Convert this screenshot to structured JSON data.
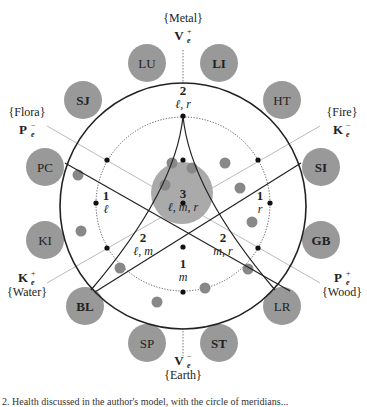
{
  "diagram": {
    "center": {
      "x": 183,
      "y": 206
    },
    "outer_radius": 123,
    "inner_dotted_radius": 87,
    "colors": {
      "node_fill": "#999999",
      "small_dot": "#888888",
      "center_blob": "#aaaaaa",
      "line": "#222222",
      "guide_line": "#bbbbbb",
      "text": "#222222"
    },
    "outer_nodes": [
      {
        "label": "LU",
        "bold": false,
        "x": 147,
        "y": 63
      },
      {
        "label": "LI",
        "bold": true,
        "x": 219,
        "y": 63
      },
      {
        "label": "HT",
        "bold": false,
        "x": 282,
        "y": 100
      },
      {
        "label": "SI",
        "bold": true,
        "x": 321,
        "y": 167
      },
      {
        "label": "GB",
        "bold": true,
        "x": 321,
        "y": 240
      },
      {
        "label": "LR",
        "bold": false,
        "x": 282,
        "y": 306
      },
      {
        "label": "ST",
        "bold": true,
        "x": 219,
        "y": 343
      },
      {
        "label": "SP",
        "bold": false,
        "x": 147,
        "y": 343
      },
      {
        "label": "BL",
        "bold": true,
        "x": 85,
        "y": 306
      },
      {
        "label": "KI",
        "bold": false,
        "x": 45,
        "y": 240
      },
      {
        "label": "PC",
        "bold": false,
        "x": 45,
        "y": 167
      },
      {
        "label": "SJ",
        "bold": true,
        "x": 83,
        "y": 100
      }
    ],
    "element_labels": [
      {
        "element": "{Metal}",
        "symbol": "V",
        "sup": "+",
        "sub": "e",
        "x": 183,
        "y": 22,
        "anchor": "middle"
      },
      {
        "element": "{Fire}",
        "symbol": "K",
        "sup": "−",
        "sub": "e",
        "x": 342,
        "y": 116,
        "anchor": "middle"
      },
      {
        "element": "{Wood}",
        "symbol": "P",
        "sup": "+",
        "sub": "e",
        "x": 342,
        "y": 282,
        "anchor": "middle"
      },
      {
        "element": "{Earth}",
        "symbol": "V",
        "sup": "−",
        "sub": "e",
        "x": 183,
        "y": 365,
        "anchor": "middle"
      },
      {
        "element": "{Water}",
        "symbol": "K",
        "sup": "+",
        "sub": "e",
        "x": 27,
        "y": 282,
        "anchor": "middle"
      },
      {
        "element": "{Flora}",
        "symbol": "P",
        "sup": "−",
        "sub": "e",
        "x": 27,
        "y": 116,
        "anchor": "middle"
      }
    ],
    "region_labels": [
      {
        "num": "2",
        "vars": "ℓ, r",
        "x": 183,
        "y": 95
      },
      {
        "num": "3",
        "vars": "ℓ, m, r",
        "x": 183,
        "y": 198
      },
      {
        "num": "1",
        "vars": "ℓ",
        "x": 106,
        "y": 200
      },
      {
        "num": "1",
        "vars": "r",
        "x": 260,
        "y": 200
      },
      {
        "num": "2",
        "vars": "ℓ, m",
        "x": 143,
        "y": 242
      },
      {
        "num": "2",
        "vars": "m, r",
        "x": 223,
        "y": 242
      },
      {
        "num": "1",
        "vars": "m",
        "x": 183,
        "y": 268
      }
    ],
    "black_dots": [
      {
        "x": 183,
        "y": 116
      },
      {
        "x": 183,
        "y": 160
      },
      {
        "x": 183,
        "y": 203
      },
      {
        "x": 183,
        "y": 247
      },
      {
        "x": 183,
        "y": 292
      },
      {
        "x": 107,
        "y": 160
      },
      {
        "x": 96,
        "y": 203
      },
      {
        "x": 107,
        "y": 248
      },
      {
        "x": 258,
        "y": 160
      },
      {
        "x": 270,
        "y": 203
      },
      {
        "x": 258,
        "y": 248
      }
    ],
    "grey_dots": [
      {
        "x": 78,
        "y": 175
      },
      {
        "x": 81,
        "y": 231
      },
      {
        "x": 120,
        "y": 268
      },
      {
        "x": 157,
        "y": 302
      },
      {
        "x": 172,
        "y": 163
      },
      {
        "x": 192,
        "y": 168
      },
      {
        "x": 165,
        "y": 185
      },
      {
        "x": 225,
        "y": 163
      },
      {
        "x": 240,
        "y": 188
      },
      {
        "x": 252,
        "y": 222
      },
      {
        "x": 248,
        "y": 269
      },
      {
        "x": 205,
        "y": 288
      }
    ],
    "center_blob": {
      "x": 182,
      "y": 193,
      "r": 31
    }
  },
  "caption": "2. Health discussed in the author's model, with the circle of meridians..."
}
